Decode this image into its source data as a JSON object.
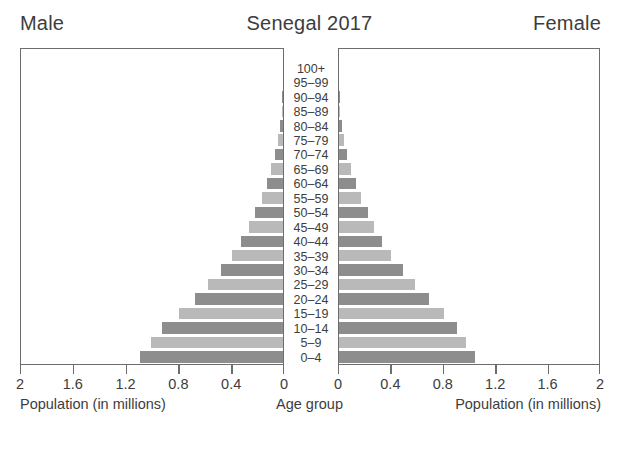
{
  "header": {
    "left_label": "Male",
    "title": "Senegal 2017",
    "right_label": "Female"
  },
  "axes": {
    "left_title": "Population (in millions)",
    "center_title": "Age group",
    "right_title": "Population (in millions)",
    "left_ticks": [
      "2",
      "1.6",
      "1.2",
      "0.8",
      "0.4",
      "0"
    ],
    "right_ticks": [
      "0",
      "0.4",
      "0.8",
      "1.2",
      "1.6",
      "2"
    ]
  },
  "style": {
    "bar_dark": "#8d8d8d",
    "bar_light": "#b9b9b9",
    "frame": "#6d6d6d",
    "text": "#3d3d3d",
    "background": "#ffffff"
  },
  "chart_data": {
    "type": "bar",
    "subtype": "population-pyramid",
    "title": "Senegal 2017",
    "xlabel": "Population (in millions)",
    "ylabel": "Age group",
    "xlim": [
      0,
      2
    ],
    "xticks": [
      0,
      0.4,
      0.8,
      1.2,
      1.6,
      2
    ],
    "grid": false,
    "legend": "none",
    "units": "millions",
    "categories": [
      "100+",
      "95–99",
      "90–94",
      "85–89",
      "80–84",
      "75–79",
      "70–74",
      "65–69",
      "60–64",
      "55–59",
      "50–54",
      "45–49",
      "40–44",
      "35–39",
      "30–34",
      "25–29",
      "20–24",
      "15–19",
      "10–14",
      "5–9",
      "0–4"
    ],
    "series": [
      {
        "name": "Male",
        "side": "left",
        "values": [
          0.0,
          0.0,
          0.005,
          0.01,
          0.02,
          0.04,
          0.06,
          0.09,
          0.12,
          0.16,
          0.21,
          0.26,
          0.32,
          0.39,
          0.47,
          0.57,
          0.67,
          0.79,
          0.92,
          1.0,
          1.08
        ]
      },
      {
        "name": "Female",
        "side": "right",
        "values": [
          0.0,
          0.0,
          0.005,
          0.01,
          0.02,
          0.04,
          0.06,
          0.09,
          0.13,
          0.17,
          0.22,
          0.27,
          0.33,
          0.4,
          0.49,
          0.58,
          0.69,
          0.8,
          0.9,
          0.97,
          1.04
        ]
      }
    ]
  }
}
